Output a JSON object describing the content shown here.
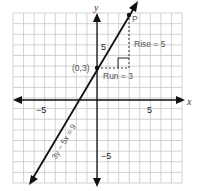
{
  "chart_data": {
    "type": "line",
    "title": "",
    "xlabel": "x",
    "ylabel": "y",
    "xlim": [
      -8,
      8
    ],
    "ylim": [
      -8,
      8
    ],
    "grid": true,
    "tick_labels": {
      "x": [
        {
          "value": -5,
          "label": "−5"
        },
        {
          "value": 5,
          "label": "5"
        }
      ],
      "y": [
        {
          "value": 5,
          "label": "5"
        },
        {
          "value": -5,
          "label": "−5"
        }
      ]
    },
    "series": [
      {
        "name": "3y − 5x = 9",
        "equation": "3y - 5x = 9",
        "slope": 1.6667,
        "intercept": 3,
        "points": [
          {
            "x": -8,
            "y": -10.33
          },
          {
            "x": 3.8,
            "y": 9.33
          }
        ]
      }
    ],
    "annotations": [
      {
        "type": "point",
        "label": "(0,3)",
        "x": 0,
        "y": 3
      },
      {
        "type": "point",
        "label": "P",
        "x": 3,
        "y": 8
      },
      {
        "type": "segment",
        "style": "dashed",
        "label": "Run = 3",
        "from": {
          "x": 0,
          "y": 3
        },
        "to": {
          "x": 3,
          "y": 3
        }
      },
      {
        "type": "segment",
        "style": "dashed",
        "label": "Rise = 5",
        "from": {
          "x": 3,
          "y": 3
        },
        "to": {
          "x": 3,
          "y": 8
        }
      },
      {
        "type": "right-angle-marker",
        "at": {
          "x": 3,
          "y": 3
        }
      }
    ]
  },
  "labels": {
    "x_axis": "x",
    "y_axis": "y",
    "x_tick_neg5": "−5",
    "x_tick_5": "5",
    "y_tick_5": "5",
    "y_tick_neg5": "−5",
    "point_intercept": "(0,3)",
    "point_p": "P",
    "rise": "Rise = 5",
    "run": "Run = 3",
    "equation": "3y − 5x = 9"
  },
  "colors": {
    "grid": "#c8c8c8",
    "axis": "#111111",
    "line": "#111111",
    "text": "#555555",
    "dashed": "#333333"
  }
}
